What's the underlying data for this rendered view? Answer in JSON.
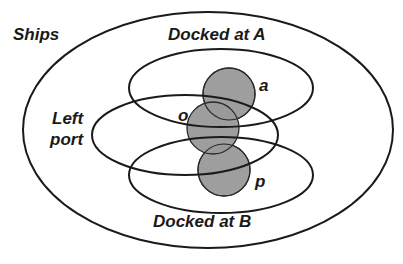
{
  "diagram": {
    "type": "venn",
    "colors": {
      "stroke": "#1a1a1a",
      "disc_fill": "#999999",
      "background": "#ffffff"
    },
    "sets": [
      {
        "id": "ships",
        "label": "Ships"
      },
      {
        "id": "docked_a",
        "label": "Docked at A"
      },
      {
        "id": "left_port",
        "label": "Left port",
        "label_lines": [
          "Left",
          "port"
        ]
      },
      {
        "id": "docked_b",
        "label": "Docked at B"
      }
    ],
    "elements": [
      {
        "id": "a",
        "label": "a",
        "in_sets": [
          "ships",
          "docked_a",
          "left_port"
        ]
      },
      {
        "id": "o",
        "label": "o",
        "in_sets": [
          "ships",
          "docked_a",
          "left_port",
          "docked_b"
        ]
      },
      {
        "id": "p",
        "label": "p",
        "in_sets": [
          "ships",
          "left_port",
          "docked_b"
        ]
      }
    ]
  }
}
